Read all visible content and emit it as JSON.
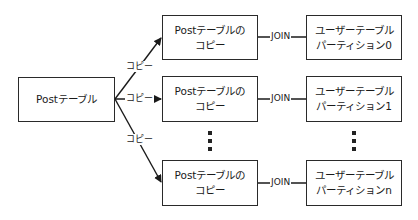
{
  "source": {
    "line1": "Postテーブル"
  },
  "copies": [
    {
      "line1": "Postテーブルの",
      "line2": "コピー"
    },
    {
      "line1": "Postテーブルの",
      "line2": "コピー"
    },
    {
      "line1": "Postテーブルの",
      "line2": "コピー"
    }
  ],
  "partitions": [
    {
      "line1": "ユーザーテーブル",
      "line2": "パーティション0"
    },
    {
      "line1": "ユーザーテーブル",
      "line2": "パーティション1"
    },
    {
      "line1": "ユーザーテーブル",
      "line2": "パーティションn"
    }
  ],
  "edges": {
    "copy_label": "コピー",
    "join_label": "JOIN"
  },
  "ellipsis": "⋮"
}
